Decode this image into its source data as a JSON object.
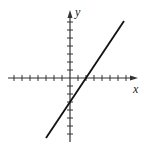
{
  "chart_data": {
    "type": "line",
    "title": "",
    "xlabel": "x",
    "ylabel": "y",
    "xlim": [
      -8,
      8
    ],
    "ylim": [
      -8,
      8
    ],
    "grid": false,
    "x_ticks_left": 7,
    "x_ticks_right": 7,
    "y_ticks_up": 7,
    "y_ticks_down": 7,
    "series": [
      {
        "name": "line",
        "equation": "y = 1.5x - 3",
        "x": [
          -3,
          6.75
        ],
        "y": [
          -7.5,
          7.125
        ],
        "x_intercept": 2,
        "y_intercept": -3
      }
    ],
    "colors": {
      "axis": "#333333",
      "line": "#111111"
    }
  },
  "labels": {
    "x": "x",
    "y": "y"
  }
}
